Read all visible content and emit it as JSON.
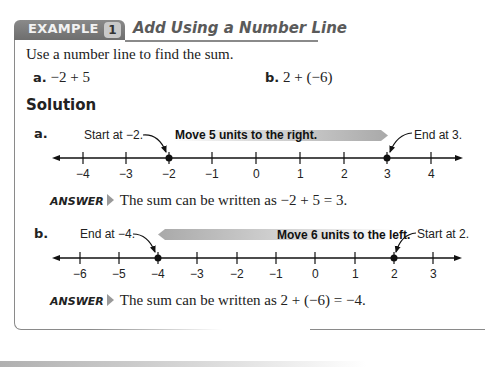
{
  "example": {
    "tab_label": "EXAMPLE",
    "number": "1",
    "title": "Add Using a Number Line"
  },
  "prompt": "Use a number line to find the sum.",
  "problems": [
    {
      "label": "a.",
      "expression": "−2 + 5"
    },
    {
      "label": "b.",
      "expression": "2 + (−6)"
    }
  ],
  "solution_heading": "Solution",
  "parts": [
    {
      "label": "a.",
      "start_note": "Start at −2.",
      "move_note": "Move 5 units to the right.",
      "end_note": "End at 3.",
      "ticks": [
        "−4",
        "−3",
        "−2",
        "−1",
        "0",
        "1",
        "2",
        "3",
        "4"
      ],
      "start_value": -2,
      "end_value": 3,
      "answer_keyword": "ANSWER",
      "answer_text": "The sum can be written as −2 + 5 = 3."
    },
    {
      "label": "b.",
      "start_note": "Start at 2.",
      "move_note": "Move 6 units to the left.",
      "end_note": "End at −4.",
      "ticks": [
        "−6",
        "−5",
        "−4",
        "−3",
        "−2",
        "−1",
        "0",
        "1",
        "2",
        "3"
      ],
      "start_value": 2,
      "end_value": -4,
      "answer_keyword": "ANSWER",
      "answer_text": "The sum can be written as 2 + (−6) = −4."
    }
  ],
  "colors": {
    "tab_gray": "#7a7a7a",
    "badge_gray": "#c9c9c9",
    "title_gray": "#5a5a5a",
    "move_band": "#b5b5b5"
  }
}
